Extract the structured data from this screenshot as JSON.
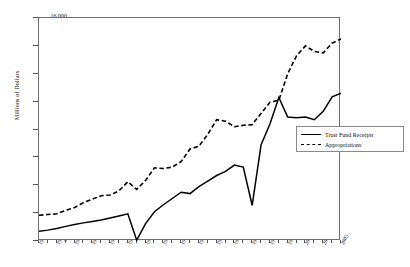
{
  "chart_data": {
    "type": "line",
    "title": "",
    "xlabel": "",
    "ylabel": "Millions of Dollars",
    "ylim": [
      0,
      16000
    ],
    "ytick_step": 2000,
    "ytick_labels": [
      "0",
      "2,000",
      "4,000",
      "6,000",
      "8,000",
      "10,000",
      "12,000",
      "14,000",
      "16,000"
    ],
    "xlim": [
      1971,
      2005
    ],
    "grid": false,
    "legend_position": "right-middle",
    "x": [
      1971,
      1972,
      1973,
      1974,
      1975,
      1976,
      1977,
      1978,
      1979,
      1980,
      1981,
      1982,
      1983,
      1984,
      1985,
      1986,
      1987,
      1988,
      1989,
      1990,
      1991,
      1992,
      1993,
      1994,
      1995,
      1996,
      1997,
      1998,
      1999,
      2000,
      2001,
      2002,
      2003,
      2004,
      2005
    ],
    "xtick_labels": [
      "1971",
      "1973",
      "1975",
      "1977",
      "1979",
      "1981",
      "1983",
      "1985",
      "1987",
      "1989",
      "1991",
      "1993",
      "1995",
      "1997",
      "1999",
      "2001",
      "2003",
      "2005"
    ],
    "series": [
      {
        "name": "Trust Fund Receipts",
        "style": "solid",
        "color": "#000000",
        "values": [
          700,
          780,
          900,
          1050,
          1180,
          1300,
          1400,
          1500,
          1650,
          1800,
          1950,
          60,
          1250,
          2100,
          2600,
          3050,
          3500,
          3400,
          3900,
          4300,
          4700,
          5000,
          5450,
          5300,
          2550,
          6900,
          8400,
          10300,
          8900,
          8850,
          8900,
          8700,
          9300,
          10350,
          10600
        ]
      },
      {
        "name": "Appropriations",
        "style": "dashed",
        "color": "#000000",
        "values": [
          1850,
          1900,
          1950,
          2200,
          2400,
          2750,
          3000,
          3250,
          3300,
          3600,
          4250,
          3700,
          4350,
          5250,
          5200,
          5300,
          5700,
          6600,
          6800,
          7650,
          8700,
          8600,
          8200,
          8300,
          8350,
          9150,
          9950,
          10100,
          12000,
          13300,
          14000,
          13600,
          13500,
          14200,
          14500
        ]
      }
    ]
  },
  "legend": {
    "items": [
      {
        "label": "Trust Fund Receipts",
        "style": "solid"
      },
      {
        "label": "Appropriations",
        "style": "dashed"
      }
    ]
  },
  "axes": {
    "y_title": "Millions of Dollars"
  }
}
